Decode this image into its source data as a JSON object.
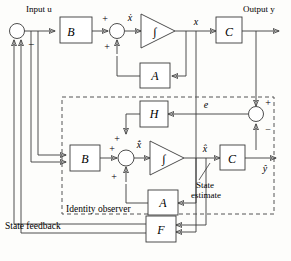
{
  "diagram": {
    "line_color": "#3a3a3a",
    "fill_color": "#ffffff",
    "dashed_color": "#555555"
  },
  "signals": {
    "input": "Input u",
    "output": "Output y",
    "xdot": "ẋ",
    "x": "x",
    "xhatdot": "x̂̇",
    "xhat": "x̂",
    "yhat": "ŷ",
    "error": "e"
  },
  "blocks": {
    "b_plant": "B",
    "a_plant": "A",
    "c_plant": "C",
    "b_obs": "B",
    "a_obs": "A",
    "c_obs": "C",
    "h_gain": "H",
    "f_gain": "F",
    "integrator_plant": "∫",
    "integrator_obs": "∫"
  },
  "annotations": {
    "identity_observer": "Identity observer",
    "state_feedback": "State feedback",
    "state_estimate_line1": "State",
    "state_estimate_line2": "estimate"
  },
  "signs": {
    "input_sum_minus": "−",
    "plant_sum_plus_top": "+",
    "plant_sum_plus_bottom": "+",
    "obs_sum_plus_top": "+",
    "obs_sum_plus_left": "+",
    "obs_sum_plus_bottom": "+",
    "err_sum_plus": "+",
    "err_sum_minus": "−"
  }
}
